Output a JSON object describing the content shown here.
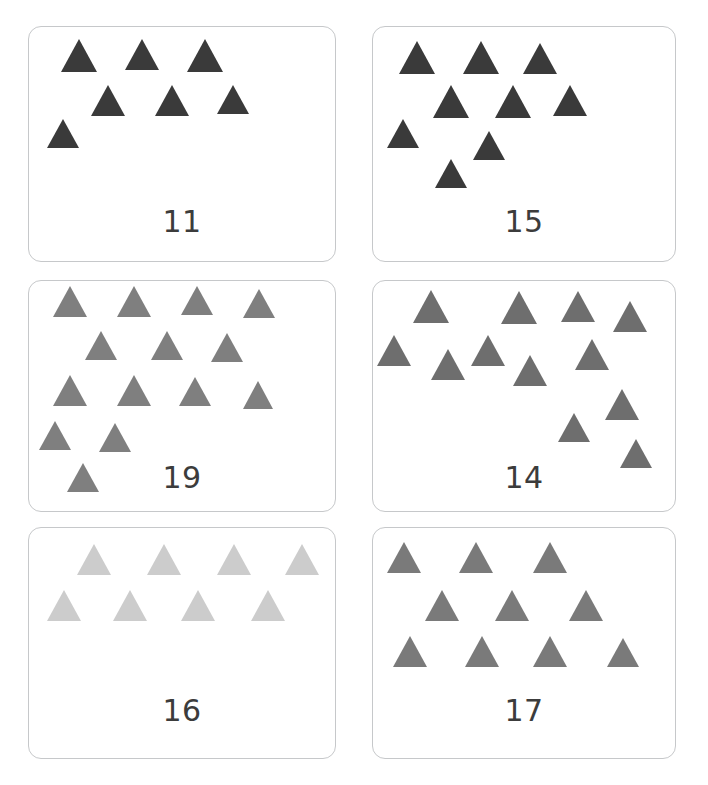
{
  "page": {
    "background_color": "#ffffff",
    "width": 708,
    "height": 785,
    "card_border_color": "#c6c8ca"
  },
  "cards": [
    {
      "id": "card-11",
      "label": "11",
      "actual_triangle_count": 7,
      "shape": "triangle",
      "color": "#3a3a3a",
      "frame": {
        "x": 28,
        "y": 26,
        "w": 308,
        "h": 236
      },
      "label_position": {
        "x": 0,
        "y": 180
      },
      "triangles": [
        {
          "x": 32,
          "y": 12,
          "size": 36
        },
        {
          "x": 96,
          "y": 12,
          "size": 34
        },
        {
          "x": 158,
          "y": 12,
          "size": 36
        },
        {
          "x": 62,
          "y": 58,
          "size": 34
        },
        {
          "x": 126,
          "y": 58,
          "size": 34
        },
        {
          "x": 188,
          "y": 58,
          "size": 32
        },
        {
          "x": 18,
          "y": 92,
          "size": 32
        }
      ]
    },
    {
      "id": "card-15",
      "label": "15",
      "actual_triangle_count": 9,
      "shape": "triangle",
      "color": "#3a3a3a",
      "frame": {
        "x": 372,
        "y": 26,
        "w": 304,
        "h": 236
      },
      "label_position": {
        "x": 0,
        "y": 180
      },
      "triangles": [
        {
          "x": 26,
          "y": 14,
          "size": 36
        },
        {
          "x": 90,
          "y": 14,
          "size": 36
        },
        {
          "x": 150,
          "y": 16,
          "size": 34
        },
        {
          "x": 60,
          "y": 58,
          "size": 36
        },
        {
          "x": 122,
          "y": 58,
          "size": 36
        },
        {
          "x": 180,
          "y": 58,
          "size": 34
        },
        {
          "x": 14,
          "y": 92,
          "size": 32
        },
        {
          "x": 100,
          "y": 104,
          "size": 32
        },
        {
          "x": 62,
          "y": 132,
          "size": 32
        }
      ]
    },
    {
      "id": "card-19",
      "label": "19",
      "actual_triangle_count": 14,
      "shape": "triangle",
      "color": "#7f7f7f",
      "frame": {
        "x": 28,
        "y": 280,
        "w": 308,
        "h": 232
      },
      "label_position": {
        "x": 0,
        "y": 182
      },
      "triangles": [
        {
          "x": 24,
          "y": 5,
          "size": 34
        },
        {
          "x": 88,
          "y": 5,
          "size": 34
        },
        {
          "x": 152,
          "y": 5,
          "size": 32
        },
        {
          "x": 214,
          "y": 8,
          "size": 32
        },
        {
          "x": 56,
          "y": 50,
          "size": 32
        },
        {
          "x": 122,
          "y": 50,
          "size": 32
        },
        {
          "x": 182,
          "y": 52,
          "size": 32
        },
        {
          "x": 24,
          "y": 94,
          "size": 34
        },
        {
          "x": 88,
          "y": 94,
          "size": 34
        },
        {
          "x": 150,
          "y": 96,
          "size": 32
        },
        {
          "x": 214,
          "y": 100,
          "size": 30
        },
        {
          "x": 10,
          "y": 140,
          "size": 32
        },
        {
          "x": 70,
          "y": 142,
          "size": 32
        },
        {
          "x": 38,
          "y": 182,
          "size": 32
        }
      ]
    },
    {
      "id": "card-14",
      "label": "14",
      "actual_triangle_count": 13,
      "shape": "triangle",
      "color": "#6e6e6e",
      "frame": {
        "x": 372,
        "y": 280,
        "w": 304,
        "h": 232
      },
      "label_position": {
        "x": 0,
        "y": 182
      },
      "triangles": [
        {
          "x": 40,
          "y": 9,
          "size": 36
        },
        {
          "x": 128,
          "y": 10,
          "size": 36
        },
        {
          "x": 188,
          "y": 10,
          "size": 34
        },
        {
          "x": 240,
          "y": 20,
          "size": 34
        },
        {
          "x": 4,
          "y": 54,
          "size": 34
        },
        {
          "x": 58,
          "y": 68,
          "size": 34
        },
        {
          "x": 98,
          "y": 54,
          "size": 34
        },
        {
          "x": 140,
          "y": 74,
          "size": 34
        },
        {
          "x": 202,
          "y": 58,
          "size": 34
        },
        {
          "x": 232,
          "y": 108,
          "size": 34
        },
        {
          "x": 185,
          "y": 132,
          "size": 32
        },
        {
          "x": 247,
          "y": 158,
          "size": 32
        }
      ]
    },
    {
      "id": "card-16",
      "label": "16",
      "actual_triangle_count": 8,
      "shape": "triangle",
      "color": "#cccccc",
      "frame": {
        "x": 28,
        "y": 527,
        "w": 308,
        "h": 232
      },
      "label_position": {
        "x": 0,
        "y": 168
      },
      "triangles": [
        {
          "x": 48,
          "y": 16,
          "size": 34
        },
        {
          "x": 118,
          "y": 16,
          "size": 34
        },
        {
          "x": 188,
          "y": 16,
          "size": 34
        },
        {
          "x": 256,
          "y": 16,
          "size": 34
        },
        {
          "x": 18,
          "y": 62,
          "size": 34
        },
        {
          "x": 84,
          "y": 62,
          "size": 34
        },
        {
          "x": 152,
          "y": 62,
          "size": 34
        },
        {
          "x": 222,
          "y": 62,
          "size": 34
        }
      ]
    },
    {
      "id": "card-17",
      "label": "17",
      "actual_triangle_count": 10,
      "shape": "triangle",
      "color": "#7a7a7a",
      "frame": {
        "x": 372,
        "y": 527,
        "w": 304,
        "h": 232
      },
      "label_position": {
        "x": 0,
        "y": 168
      },
      "triangles": [
        {
          "x": 14,
          "y": 14,
          "size": 34
        },
        {
          "x": 86,
          "y": 14,
          "size": 34
        },
        {
          "x": 160,
          "y": 14,
          "size": 34
        },
        {
          "x": 52,
          "y": 62,
          "size": 34
        },
        {
          "x": 122,
          "y": 62,
          "size": 34
        },
        {
          "x": 196,
          "y": 62,
          "size": 34
        },
        {
          "x": 20,
          "y": 108,
          "size": 34
        },
        {
          "x": 92,
          "y": 108,
          "size": 34
        },
        {
          "x": 160,
          "y": 108,
          "size": 34
        },
        {
          "x": 234,
          "y": 110,
          "size": 32
        }
      ]
    }
  ]
}
